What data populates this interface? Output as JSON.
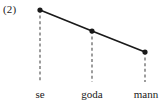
{
  "figure": {
    "index_label": "(2)",
    "colors": {
      "background": "#ffffff",
      "line": "#1a1a1a",
      "marker": "#1a1a1a",
      "dropline": "#4d4d4d",
      "text": "#1a1a1a"
    }
  },
  "chart_data": {
    "type": "line",
    "title": "(2)",
    "xlabel": "",
    "ylabel": "",
    "grid": false,
    "legend": null,
    "categories": [
      "se",
      "goda",
      "mann"
    ],
    "values": [
      3,
      2,
      1
    ],
    "tick_labels": [
      "se",
      "goda",
      "mann"
    ],
    "points": [
      {
        "label": "se",
        "x": 40,
        "y": 10
      },
      {
        "label": "goda",
        "x": 92,
        "y": 31
      },
      {
        "label": "mann",
        "x": 145,
        "y": 52
      }
    ],
    "droplines": [
      {
        "label": "se",
        "x": 40,
        "y_top": 10,
        "y_bottom": 82
      },
      {
        "label": "goda",
        "x": 92,
        "y_top": 31,
        "y_bottom": 82
      },
      {
        "label": "mann",
        "x": 145,
        "y_top": 52,
        "y_bottom": 82
      }
    ],
    "label_positions": [
      {
        "label": "se",
        "x": 40,
        "y": 88
      },
      {
        "label": "goda",
        "x": 92,
        "y": 88
      },
      {
        "label": "mann",
        "x": 146,
        "y": 88
      }
    ]
  }
}
